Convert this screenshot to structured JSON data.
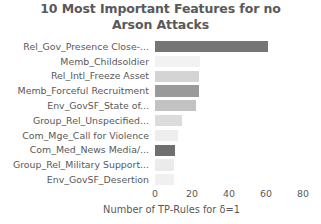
{
  "chart_data": {
    "type": "bar",
    "orientation": "horizontal",
    "title": "10 Most Important Features for no Arson Attacks",
    "title_lines": [
      "10 Most Important Features for no",
      "Arson Attacks"
    ],
    "xlabel": "Number of TP-Rules for δ=1",
    "ylabel": "",
    "xlim": [
      0,
      80
    ],
    "xticks": [
      0,
      20,
      40,
      60,
      80
    ],
    "xtick_labels": [
      "0",
      "20",
      "40",
      "60",
      "80"
    ],
    "grid": false,
    "legend": null,
    "categories": [
      "Rel_Gov_Presence Close-...",
      "Memb_Childsoldier",
      "Rel_Intl_Freeze Asset",
      "Memb_Forceful Recruitment",
      "Env_GovSF_State of...",
      "Group_Rel_Unspecified...",
      "Com_Mge_Call for Violence",
      "Com_Med_News Media/...",
      "Group_Rel_Military Support...",
      "Env_GovSF_Desertion"
    ],
    "values": [
      61,
      24.5,
      24,
      24,
      22,
      14.5,
      12.5,
      11,
      10.5,
      10
    ],
    "bar_colors": [
      "#757575",
      "#f2f2f2",
      "#d4d4d4",
      "#9a9a9a",
      "#c2c2c2",
      "#dcdcdc",
      "#eeeeee",
      "#6f6f6f",
      "#ebebeb",
      "#f0f0f0"
    ]
  },
  "colors": {
    "text": "#595959",
    "background": "#ffffff"
  }
}
